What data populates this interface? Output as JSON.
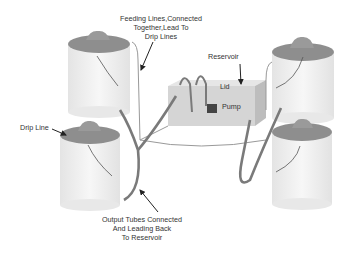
{
  "labels": {
    "feeding_lines": [
      "Feeding Lines,Connected",
      "Together,Lead To",
      "Drip Lines"
    ],
    "reservoir": "Reservoir",
    "lid": "Lid",
    "pump": "Pump",
    "drip_line": "Drip Line",
    "output_tubes": [
      "Output Tubes Connected",
      "And Leading Back",
      "To Reservoir"
    ]
  },
  "colors": {
    "bucket": "#f1f1f1",
    "bucket_rim": "#8e8e8e",
    "tube": "#7a7a7a",
    "reservoir": "#d6d6d6",
    "pump": "#444444",
    "text": "#333333"
  }
}
